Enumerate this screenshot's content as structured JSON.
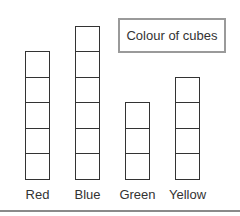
{
  "chart_data": {
    "type": "bar",
    "title": "Colour of cubes",
    "categories": [
      "Red",
      "Blue",
      "Green",
      "Yellow"
    ],
    "values": [
      5,
      6,
      3,
      4
    ],
    "xlabel": "",
    "ylabel": "",
    "unit": "cube",
    "style": "stacked unit squares (pictogram)",
    "grid": false,
    "legend": null
  }
}
